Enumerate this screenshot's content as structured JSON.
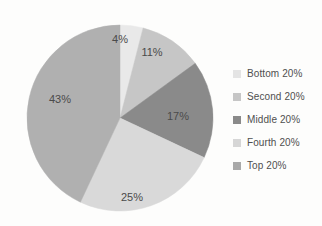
{
  "chart_data": {
    "type": "pie",
    "title": "",
    "categories": [
      "Bottom 20%",
      "Second 20%",
      "Middle 20%",
      "Fourth 20%",
      "Top 20%"
    ],
    "values": [
      4,
      11,
      17,
      25,
      43
    ],
    "data_labels": [
      "4%",
      "11%",
      "17%",
      "25%",
      "43%"
    ],
    "unit": "%",
    "start_angle_deg": 0,
    "direction": "clockwise",
    "legend_position": "right",
    "grid": false,
    "xlabel": "",
    "ylabel": "",
    "colors": [
      "#e9e9e9",
      "#c6c6c6",
      "#8a8a8a",
      "#d9d9d9",
      "#b0b0b0"
    ],
    "slices": [
      {
        "name": "Bottom 20%",
        "value": 4,
        "label": "4%",
        "color": "#e9e9e9",
        "label_x": 120,
        "label_y": 40
      },
      {
        "name": "Second 20%",
        "value": 11,
        "label": "11%",
        "color": "#c6c6c6",
        "label_x": 152,
        "label_y": 53
      },
      {
        "name": "Middle 20%",
        "value": 17,
        "label": "17%",
        "color": "#8a8a8a",
        "label_x": 178,
        "label_y": 117
      },
      {
        "name": "Fourth 20%",
        "value": 25,
        "label": "25%",
        "color": "#d9d9d9",
        "label_x": 132,
        "label_y": 198
      },
      {
        "name": "Top 20%",
        "value": 43,
        "label": "43%",
        "color": "#b0b0b0",
        "label_x": 60,
        "label_y": 100
      }
    ]
  },
  "legend": {
    "items": [
      {
        "label": "Bottom 20%",
        "color": "#e4e4e4"
      },
      {
        "label": "Second 20%",
        "color": "#c6c6c6"
      },
      {
        "label": "Middle 20%",
        "color": "#8a8a8a"
      },
      {
        "label": "Fourth 20%",
        "color": "#d6d6d6"
      },
      {
        "label": "Top 20%",
        "color": "#a9a9a9"
      }
    ]
  },
  "geometry": {
    "cx": 120,
    "cy": 118,
    "r": 93
  }
}
